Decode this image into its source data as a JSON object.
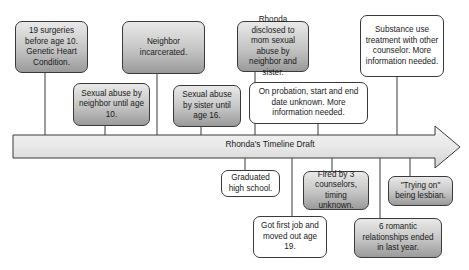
{
  "diagram": {
    "title": "Rhonda's Timeline Draft",
    "colors": {
      "box_dark_top": "#e9e9e9",
      "box_dark_bottom": "#9a9a9a",
      "line": "#3a3a3a",
      "arrow_fill": "#e6e6e6"
    },
    "events_above": [
      {
        "id": "surgeries",
        "text": "19 surgeries before age 10. Genetic Heart Condition.",
        "style": "shaded"
      },
      {
        "id": "abuse-neighbor",
        "text": "Sexual abuse by neighbor until age 10.",
        "style": "shaded"
      },
      {
        "id": "neighbor-incarcerated",
        "text": "Neighbor incarcerated.",
        "style": "shaded"
      },
      {
        "id": "abuse-sister",
        "text": "Sexual abuse by sister until age 16.",
        "style": "shaded"
      },
      {
        "id": "disclosed",
        "text": "Rhonda disclosed to mom sexual abuse by neighbor and sister.",
        "style": "shaded"
      },
      {
        "id": "probation",
        "text": "On probation, start and end date unknown. More information needed.",
        "style": "white"
      },
      {
        "id": "substance",
        "text": "Substance use treatment with other counselor. More information needed.",
        "style": "white"
      }
    ],
    "events_below": [
      {
        "id": "graduated",
        "text": "Graduated high school.",
        "style": "white"
      },
      {
        "id": "first-job",
        "text": "Got first job and moved out age 19.",
        "style": "white"
      },
      {
        "id": "fired",
        "text": "Fired by 3 counselors, timing unknown.",
        "style": "shaded"
      },
      {
        "id": "romantic",
        "text": "6 romantic relationships ended in last year.",
        "style": "shaded"
      },
      {
        "id": "trying-on",
        "text": "\"Trying on\" being lesbian.",
        "style": "shaded"
      }
    ]
  }
}
